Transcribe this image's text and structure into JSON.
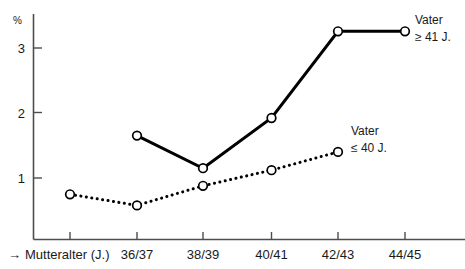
{
  "chart_data": {
    "type": "line",
    "title": "",
    "xlabel": "→ Mutteralter (J.)",
    "ylabel": "%",
    "ylim": [
      0,
      3.6
    ],
    "yticks": [
      1,
      2,
      3
    ],
    "ytick_labels": [
      "1",
      "2",
      "3"
    ],
    "grid": false,
    "legend_position": "inline-right",
    "categories": [
      "",
      "36/37",
      "38/39",
      "40/41",
      "42/43",
      "44/45"
    ],
    "xtick_labels": [
      "",
      "36/37",
      "38/39",
      "40/41",
      "42/43",
      "44/45"
    ],
    "series": [
      {
        "name": "Vater ≥ 41 J.",
        "style": "solid",
        "label_line1": "Vater",
        "label_line2": "≥ 41 J.",
        "x": [
          "36/37",
          "38/39",
          "40/41",
          "42/43",
          "44/45"
        ],
        "values": [
          1.65,
          1.15,
          1.92,
          3.25,
          3.25
        ]
      },
      {
        "name": "Vater ≤ 40 J.",
        "style": "dotted",
        "label_line1": "Vater",
        "label_line2": "≤ 40 J.",
        "x": [
          "",
          "36/37",
          "38/39",
          "40/41",
          "42/43"
        ],
        "values": [
          0.75,
          0.58,
          0.88,
          1.12,
          1.4
        ]
      }
    ]
  },
  "axes": {
    "y_unit": "%",
    "y_tick_1": "1",
    "y_tick_2": "2",
    "y_tick_3": "3",
    "x_title_arrow": "→",
    "x_title": "Mutteralter (J.)",
    "x_tick_1": "36/37",
    "x_tick_2": "38/39",
    "x_tick_3": "40/41",
    "x_tick_4": "42/43",
    "x_tick_5": "44/45"
  },
  "annotations": {
    "upper_label_line1": "Vater",
    "upper_label_line2": "≥ 41 J.",
    "lower_label_line1": "Vater",
    "lower_label_line2": "≤ 40 J."
  },
  "colors": {
    "line": "#000000",
    "axis": "#4d4d4d",
    "marker_fill": "#ffffff",
    "background": "#ffffff",
    "text": "#1a1a1a"
  }
}
